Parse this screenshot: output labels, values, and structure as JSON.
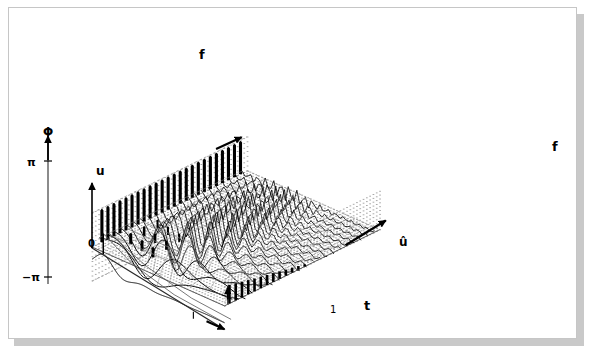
{
  "figure": {
    "background_color": "#ffffff",
    "plate_border_color": "#c6c6c6",
    "shadow_color": "#c9c9c9",
    "ink_color": "#000000",
    "grid_dot_color": "#9a9a9a"
  },
  "labels": {
    "f_back": "f",
    "f_right": "f",
    "t_axis": "t",
    "u_axis": "u",
    "u_hat_axis": "û",
    "origin": "0",
    "time_tick_one": "1",
    "phase_axis": "Φ",
    "phase_pos_pi": "π",
    "phase_neg_pi": "−π"
  },
  "chart_data": {
    "type": "line",
    "xlabel": "t",
    "ylabel": "f",
    "zlabel": "u",
    "grid": true,
    "legend": false,
    "axes": [
      {
        "name": "t",
        "label": "t",
        "ticks": [
          "1"
        ],
        "direction": "front-right"
      },
      {
        "name": "f",
        "label": "f",
        "ticks": [],
        "direction": "back-right"
      },
      {
        "name": "u",
        "label": "u",
        "ticks": [
          "0"
        ],
        "direction": "vertical"
      },
      {
        "name": "Φ",
        "label": "Φ",
        "ticks": [
          "π",
          "−π"
        ],
        "ylim": [
          -3.14159,
          3.14159
        ],
        "direction": "vertical-left-plane"
      },
      {
        "name": "û",
        "label": "û",
        "ticks": [],
        "direction": "vertical-right-plane"
      }
    ],
    "surface": {
      "description": "waterfall mesh of sinusoidal traces, frequency increasing toward the back",
      "rows": 22,
      "cols": 46,
      "cycles_min": 1,
      "cycles_max": 17
    },
    "phase_spectrum": {
      "description": "phase bars on back plane, near-constant magnitude",
      "count": 24,
      "values": [
        0.93,
        0.93,
        0.93,
        0.93,
        0.93,
        0.93,
        0.93,
        0.93,
        0.93,
        0.93,
        0.93,
        0.93,
        0.93,
        0.93,
        0.93,
        0.93,
        0.93,
        0.93,
        0.93,
        0.93,
        0.93,
        0.93,
        0.93,
        0.93
      ],
      "ylim": [
        -3.14159,
        3.14159
      ]
    },
    "magnitude_spectrum": {
      "description": "decaying magnitude stems on right plane",
      "count": 13,
      "values": [
        1.0,
        0.92,
        0.84,
        0.76,
        0.68,
        0.61,
        0.54,
        0.47,
        0.4,
        0.33,
        0.26,
        0.19,
        0.12
      ]
    },
    "stem_markers": {
      "description": "sampled impulse stems on the surface near the origin",
      "count": 9
    },
    "time_signal": {
      "description": "front-plane ringing impulse response (sinc-like) along t"
    }
  }
}
